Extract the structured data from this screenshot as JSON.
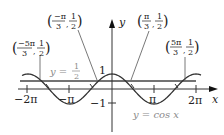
{
  "figure": {
    "curve_label": "y = cos x",
    "line_label_prefix": "y =",
    "line_label_num": "1",
    "line_label_den": "2",
    "axis_x_label": "x",
    "axis_y_label": "y",
    "y_tick_pos": "1",
    "y_tick_neg": "−1",
    "x_ticks": [
      "−2π",
      "−π",
      "π",
      "2π"
    ],
    "points": [
      {
        "num": "−5π",
        "den": "3",
        "y_num": "1",
        "y_den": "2"
      },
      {
        "num": "−π",
        "den": "3",
        "y_num": "1",
        "y_den": "2"
      },
      {
        "num": "π",
        "den": "3",
        "y_num": "1",
        "y_den": "2"
      },
      {
        "num": "5π",
        "den": "3",
        "y_num": "1",
        "y_den": "2"
      }
    ]
  },
  "chart_data": {
    "type": "line",
    "title": "",
    "xlabel": "x",
    "ylabel": "y",
    "series": [
      {
        "name": "y = cos x",
        "function": "cos(x)"
      },
      {
        "name": "y = 1/2",
        "function": "0.5"
      }
    ],
    "xlim": [
      -6.8,
      6.9
    ],
    "ylim": [
      -1.2,
      1.2
    ],
    "x_ticks": [
      "-2π",
      "-π",
      "π",
      "2π"
    ],
    "y_ticks": [
      "1",
      "-1"
    ],
    "annotations": [
      "(-5π/3, 1/2)",
      "(-π/3, 1/2)",
      "(π/3, 1/2)",
      "(5π/3, 1/2)"
    ]
  }
}
